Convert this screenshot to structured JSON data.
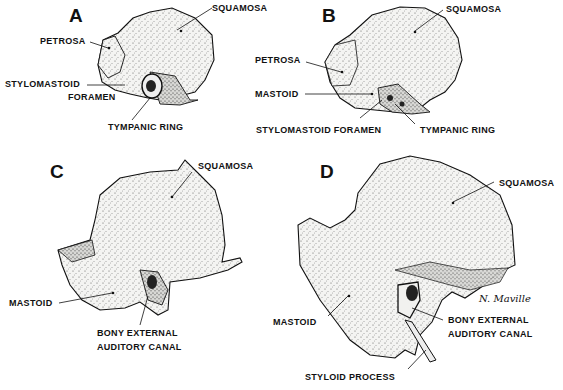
{
  "figure": {
    "panels": [
      {
        "id": "A",
        "letter": "A",
        "labels": {
          "squamosa": "SQUAMOSA",
          "petrosa": "PETROSA",
          "stylomastoid": "STYLOMASTOID",
          "foramen": "FORAMEN",
          "tympanic_ring": "TYMPANIC  RING"
        }
      },
      {
        "id": "B",
        "letter": "B",
        "labels": {
          "squamosa": "SQUAMOSA",
          "petrosa": "PETROSA",
          "mastoid": "MASTOID",
          "stylomastoid_foramen": "STYLOMASTOID  FORAMEN",
          "tympanic_ring": "TYMPANIC  RING"
        }
      },
      {
        "id": "C",
        "letter": "C",
        "labels": {
          "squamosa": "SQUAMOSA",
          "mastoid": "MASTOID",
          "canal_line1": "BONY  EXTERNAL",
          "canal_line2": "AUDITORY  CANAL"
        }
      },
      {
        "id": "D",
        "letter": "D",
        "labels": {
          "squamosa": "SQUAMOSA",
          "mastoid": "MASTOID",
          "canal_line1": "BONY  EXTERNAL",
          "canal_line2": "AUDITORY  CANAL",
          "styloid": "STYLOID  PROCESS"
        },
        "signature": "N. Maville"
      }
    ],
    "colors": {
      "ink": "#111111",
      "bone": "#f4f4f2",
      "shade": "#cfcfcc",
      "background": "#ffffff"
    }
  }
}
